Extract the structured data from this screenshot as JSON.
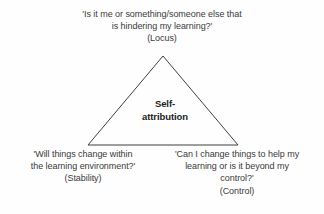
{
  "diagram": {
    "type": "triangle-model",
    "background_color": "#fefefe",
    "stroke_color": "#3f3f3f",
    "text_color": "#3a3a3a",
    "center": {
      "label_line1": "Self-",
      "label_line2": "attribution"
    },
    "vertices": [
      {
        "id": "locus",
        "position": "top",
        "question_line1": "'Is it me or something/someone else that",
        "question_line2": "is hindering my learning?'",
        "dimension": "(Locus)"
      },
      {
        "id": "stability",
        "position": "bottom-left",
        "question_line1": "'Will things change within",
        "question_line2": "the learning environment?'",
        "dimension": "(Stability)"
      },
      {
        "id": "control",
        "position": "bottom-right",
        "question_line1": "'Can I change things to help my",
        "question_line2": "learning or is it beyond my",
        "question_line3": "control?'",
        "dimension": "(Control)"
      }
    ]
  }
}
